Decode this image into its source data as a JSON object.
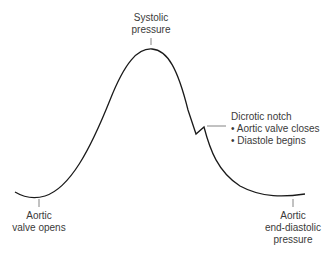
{
  "diagram": {
    "labels": {
      "systolic": {
        "line1": "Systolic",
        "line2": "pressure"
      },
      "notch": {
        "title": "Dicrotic notch",
        "bullet1": "• Aortic valve closes",
        "bullet2": "• Diastole begins"
      },
      "opens": {
        "line1": "Aortic",
        "line2": "valve opens"
      },
      "end_diastolic": {
        "line1": "Aortic",
        "line2": "end-diastolic",
        "line3": "pressure"
      }
    },
    "colors": {
      "curve": "#1a1a1a",
      "leader": "#666666",
      "text": "#3a3a3a"
    }
  }
}
